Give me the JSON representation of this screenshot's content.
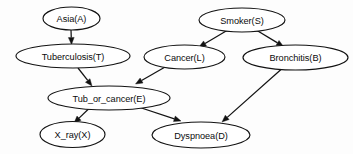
{
  "diagram": {
    "type": "directed-acyclic-graph",
    "background_color": "#fdfdfd",
    "node_fill_color": "#ffffff",
    "node_stroke_color": "#121212",
    "edge_color": "#121212",
    "text_color": "#0c0c0c",
    "nodes": [
      {
        "id": "A",
        "label": "Asia(A)",
        "cx": 71.5,
        "cy": 18.5,
        "rx": 28.5,
        "ry": 11.5
      },
      {
        "id": "T",
        "label": "Tuberculosis(T)",
        "cx": 73.0,
        "cy": 56.0,
        "rx": 57.0,
        "ry": 12.0
      },
      {
        "id": "S",
        "label": "Smoker(S)",
        "cx": 242.0,
        "cy": 20.0,
        "rx": 43.0,
        "ry": 12.0
      },
      {
        "id": "L",
        "label": "Cancer(L)",
        "cx": 184.5,
        "cy": 57.0,
        "rx": 40.5,
        "ry": 12.0
      },
      {
        "id": "B",
        "label": "Bronchitis(B)",
        "cx": 295.5,
        "cy": 57.5,
        "rx": 52.5,
        "ry": 12.5
      },
      {
        "id": "E",
        "label": "Tub_or_cancer(E)",
        "cx": 109.0,
        "cy": 98.0,
        "rx": 61.0,
        "ry": 12.0
      },
      {
        "id": "X",
        "label": "X_ray(X)",
        "cx": 72.5,
        "cy": 134.5,
        "rx": 32.5,
        "ry": 13.0
      },
      {
        "id": "D",
        "label": "Dyspnoea(D)",
        "cx": 201.0,
        "cy": 135.0,
        "rx": 49.0,
        "ry": 13.0
      }
    ],
    "edges": [
      {
        "id": "A-T",
        "from": "A",
        "to": "T",
        "from_label": "Asia(A)",
        "to_label": "Tuberculosis(T)",
        "x1": 71.0,
        "y1": 30.0,
        "x2": 71.5,
        "y2": 44.5
      },
      {
        "id": "S-L",
        "from": "S",
        "to": "L",
        "from_label": "Smoker(S)",
        "to_label": "Cancer(L)",
        "x1": 227.0,
        "y1": 30.5,
        "x2": 199.0,
        "y2": 47.0
      },
      {
        "id": "S-B",
        "from": "S",
        "to": "B",
        "from_label": "Smoker(S)",
        "to_label": "Bronchitis(B)",
        "x1": 257.0,
        "y1": 30.5,
        "x2": 283.5,
        "y2": 46.5
      },
      {
        "id": "T-E",
        "from": "T",
        "to": "E",
        "from_label": "Tuberculosis(T)",
        "to_label": "Tub_or_cancer(E)",
        "x1": 78.0,
        "y1": 68.0,
        "x2": 92.0,
        "y2": 86.0
      },
      {
        "id": "L-E",
        "from": "L",
        "to": "E",
        "from_label": "Cancer(L)",
        "to_label": "Tub_or_cancer(E)",
        "x1": 166.0,
        "y1": 66.5,
        "x2": 135.5,
        "y2": 84.0
      },
      {
        "id": "E-X",
        "from": "E",
        "to": "X",
        "from_label": "Tub_or_cancer(E)",
        "to_label": "X_ray(X)",
        "x1": 88.5,
        "y1": 109.0,
        "x2": 74.0,
        "y2": 123.0
      },
      {
        "id": "E-D",
        "from": "E",
        "to": "D",
        "from_label": "Tub_or_cancer(E)",
        "to_label": "Dyspnoea(D)",
        "x1": 140.0,
        "y1": 107.5,
        "x2": 181.0,
        "y2": 121.0
      },
      {
        "id": "B-D",
        "from": "B",
        "to": "D",
        "from_label": "Bronchitis(B)",
        "to_label": "Dyspnoea(D)",
        "x1": 281.0,
        "y1": 69.5,
        "x2": 222.0,
        "y2": 122.0
      }
    ]
  }
}
